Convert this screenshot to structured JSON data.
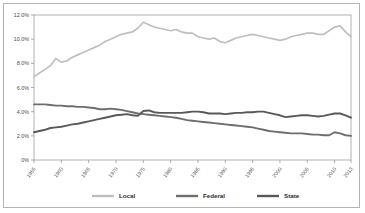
{
  "chart_data": {
    "type": "line",
    "title": "",
    "xlabel": "",
    "ylabel": "",
    "ylim": [
      0,
      12
    ],
    "xlim": [
      1955,
      2013
    ],
    "grid": false,
    "legend_position": "bottom",
    "ytick_labels": [
      "12.0%",
      "10.0%",
      "8.0%",
      "6.0%",
      "4.0%",
      "2.0%",
      "0%"
    ],
    "ytick_values": [
      12.0,
      10.0,
      8.0,
      6.0,
      4.0,
      2.0,
      0
    ],
    "xtick_labels": [
      "1955",
      "1960",
      "1965",
      "1970",
      "1975",
      "1980",
      "1985",
      "1990",
      "1995",
      "2000",
      "2005",
      "2010",
      "2013"
    ],
    "xtick_values": [
      1955,
      1960,
      1965,
      1970,
      1975,
      1980,
      1985,
      1990,
      1995,
      2000,
      2005,
      2010,
      2013
    ],
    "x": [
      1955,
      1956,
      1957,
      1958,
      1959,
      1960,
      1961,
      1962,
      1963,
      1964,
      1965,
      1966,
      1967,
      1968,
      1969,
      1970,
      1971,
      1972,
      1973,
      1974,
      1975,
      1976,
      1977,
      1978,
      1979,
      1980,
      1981,
      1982,
      1983,
      1984,
      1985,
      1986,
      1987,
      1988,
      1989,
      1990,
      1991,
      1992,
      1993,
      1994,
      1995,
      1996,
      1997,
      1998,
      1999,
      2000,
      2001,
      2002,
      2003,
      2004,
      2005,
      2006,
      2007,
      2008,
      2009,
      2010,
      2011,
      2012,
      2013
    ],
    "series": [
      {
        "name": "Local",
        "color": "#bfbfbf",
        "values": [
          6.9,
          7.2,
          7.5,
          7.8,
          8.4,
          8.1,
          8.2,
          8.5,
          8.7,
          8.9,
          9.1,
          9.3,
          9.5,
          9.8,
          10.0,
          10.2,
          10.4,
          10.5,
          10.6,
          10.9,
          11.4,
          11.2,
          11.0,
          10.9,
          10.8,
          10.7,
          10.8,
          10.6,
          10.5,
          10.5,
          10.2,
          10.1,
          10.0,
          10.1,
          9.8,
          9.7,
          9.9,
          10.1,
          10.2,
          10.3,
          10.4,
          10.3,
          10.2,
          10.1,
          10.0,
          9.9,
          10.0,
          10.2,
          10.3,
          10.4,
          10.5,
          10.5,
          10.4,
          10.4,
          10.7,
          11.0,
          11.1,
          10.6,
          10.2
        ]
      },
      {
        "name": "Federal",
        "color": "#6e6e6e",
        "values": [
          4.6,
          4.6,
          4.6,
          4.55,
          4.5,
          4.5,
          4.45,
          4.45,
          4.4,
          4.4,
          4.35,
          4.3,
          4.2,
          4.2,
          4.25,
          4.2,
          4.15,
          4.05,
          3.95,
          3.85,
          3.8,
          3.75,
          3.7,
          3.65,
          3.6,
          3.55,
          3.5,
          3.4,
          3.3,
          3.25,
          3.2,
          3.15,
          3.1,
          3.05,
          3.0,
          2.95,
          2.9,
          2.85,
          2.8,
          2.75,
          2.7,
          2.6,
          2.5,
          2.4,
          2.35,
          2.3,
          2.25,
          2.2,
          2.2,
          2.2,
          2.15,
          2.1,
          2.1,
          2.05,
          2.05,
          2.3,
          2.2,
          2.05,
          2.0
        ]
      },
      {
        "name": "State",
        "color": "#595959",
        "values": [
          2.3,
          2.4,
          2.5,
          2.65,
          2.7,
          2.75,
          2.85,
          2.95,
          3.0,
          3.1,
          3.2,
          3.3,
          3.4,
          3.5,
          3.6,
          3.7,
          3.75,
          3.8,
          3.7,
          3.65,
          4.05,
          4.1,
          3.95,
          3.9,
          3.9,
          3.9,
          3.9,
          3.9,
          3.95,
          4.0,
          4.0,
          3.95,
          3.85,
          3.85,
          3.85,
          3.8,
          3.85,
          3.9,
          3.9,
          3.95,
          3.95,
          4.0,
          4.0,
          3.9,
          3.8,
          3.7,
          3.55,
          3.6,
          3.65,
          3.7,
          3.7,
          3.65,
          3.6,
          3.65,
          3.75,
          3.85,
          3.85,
          3.7,
          3.5
        ]
      }
    ]
  },
  "legend": {
    "items": [
      {
        "label": "Local"
      },
      {
        "label": "Federal"
      },
      {
        "label": "State"
      }
    ]
  }
}
